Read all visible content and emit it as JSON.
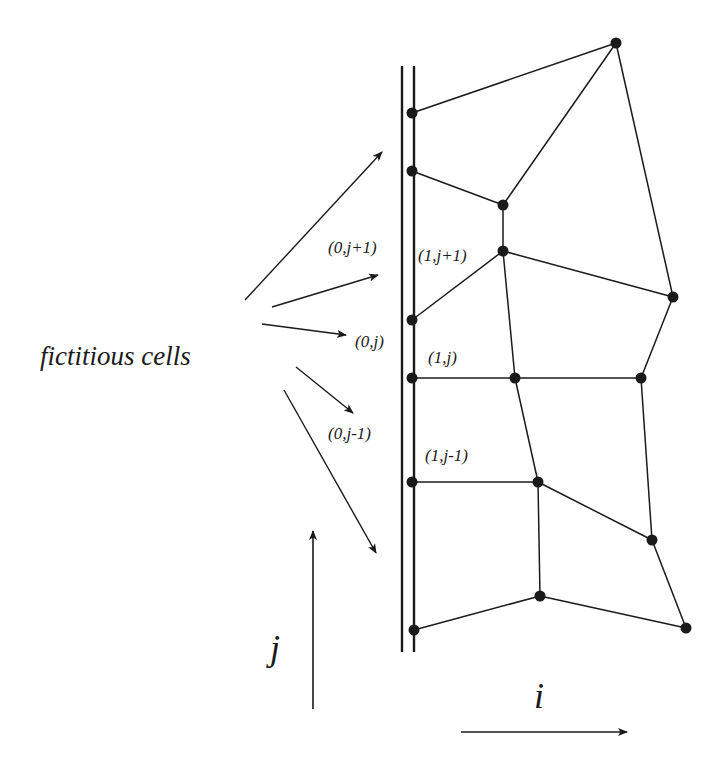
{
  "title": "fictitious cells",
  "colors": {
    "ink": "#1a1a1a",
    "background": "#ffffff"
  },
  "boundary": {
    "lines": [
      {
        "x": 402,
        "y1": 66,
        "y2": 652
      },
      {
        "x": 414,
        "y1": 66,
        "y2": 652
      }
    ]
  },
  "nodes": [
    {
      "id": "n0",
      "x": 616,
      "y": 43
    },
    {
      "id": "n1",
      "x": 412,
      "y": 113
    },
    {
      "id": "n2",
      "x": 412,
      "y": 171
    },
    {
      "id": "n3",
      "x": 503,
      "y": 205
    },
    {
      "id": "n4",
      "x": 503,
      "y": 251
    },
    {
      "id": "n5",
      "x": 673,
      "y": 297
    },
    {
      "id": "n6",
      "x": 412,
      "y": 320
    },
    {
      "id": "n7",
      "x": 412,
      "y": 378
    },
    {
      "id": "n8",
      "x": 515,
      "y": 378
    },
    {
      "id": "n9",
      "x": 641,
      "y": 378
    },
    {
      "id": "n10",
      "x": 412,
      "y": 482
    },
    {
      "id": "n11",
      "x": 538,
      "y": 482
    },
    {
      "id": "n12",
      "x": 652,
      "y": 540
    },
    {
      "id": "n13",
      "x": 540,
      "y": 596
    },
    {
      "id": "n14",
      "x": 414,
      "y": 630
    },
    {
      "id": "n15",
      "x": 686,
      "y": 628
    }
  ],
  "edges": [
    [
      "n1",
      "n0"
    ],
    [
      "n0",
      "n3"
    ],
    [
      "n0",
      "n5"
    ],
    [
      "n2",
      "n3"
    ],
    [
      "n3",
      "n4"
    ],
    [
      "n6",
      "n4"
    ],
    [
      "n4",
      "n5"
    ],
    [
      "n4",
      "n8"
    ],
    [
      "n5",
      "n9"
    ],
    [
      "n7",
      "n8"
    ],
    [
      "n8",
      "n9"
    ],
    [
      "n8",
      "n11"
    ],
    [
      "n9",
      "n12"
    ],
    [
      "n10",
      "n11"
    ],
    [
      "n11",
      "n12"
    ],
    [
      "n11",
      "n13"
    ],
    [
      "n12",
      "n15"
    ],
    [
      "n14",
      "n13"
    ],
    [
      "n13",
      "n15"
    ]
  ],
  "pointer_arrows": [
    {
      "x1": 245,
      "y1": 300,
      "x2": 382,
      "y2": 152
    },
    {
      "x1": 272,
      "y1": 307,
      "x2": 378,
      "y2": 275
    },
    {
      "x1": 262,
      "y1": 324,
      "x2": 346,
      "y2": 335
    },
    {
      "x1": 296,
      "y1": 367,
      "x2": 353,
      "y2": 413
    },
    {
      "x1": 284,
      "y1": 390,
      "x2": 376,
      "y2": 553
    }
  ],
  "cell_labels": [
    {
      "id": "lbl-0-jp1",
      "text": "(0,j+1)",
      "x": 328,
      "y": 253
    },
    {
      "id": "lbl-1-jp1",
      "text": "(1,j+1)",
      "x": 418,
      "y": 261
    },
    {
      "id": "lbl-0-j",
      "text": "(0,j)",
      "x": 355,
      "y": 347
    },
    {
      "id": "lbl-1-j",
      "text": "(1,j)",
      "x": 428,
      "y": 363
    },
    {
      "id": "lbl-0-jm1",
      "text": "(0,j-1)",
      "x": 328,
      "y": 439
    },
    {
      "id": "lbl-1-jm1",
      "text": "(1,j-1)",
      "x": 425,
      "y": 461
    }
  ],
  "fictitious_label": {
    "text": "fictitious cells",
    "x": 40,
    "y": 365
  },
  "axes": {
    "j": {
      "label": "j",
      "label_x": 270,
      "label_y": 660,
      "x1": 313,
      "y1": 709,
      "x2": 313,
      "y2": 531
    },
    "i": {
      "label": "i",
      "label_x": 534,
      "label_y": 708,
      "x1": 461,
      "y1": 732,
      "x2": 627,
      "y2": 732
    }
  }
}
